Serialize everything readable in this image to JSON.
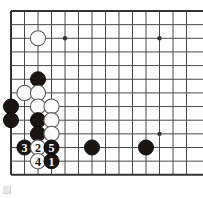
{
  "diagram": {
    "kind": "go-board-diagram",
    "board": {
      "columns": 14,
      "rows": 13,
      "origin_x": 11,
      "origin_y": 11,
      "step_x": 13.5,
      "step_y": 13.65,
      "line_color": "#4a4a4a",
      "edge_color": "#333333",
      "line_width": 1,
      "edge_width": 2,
      "background_color": "#ffffff",
      "left_edge_is_border": true,
      "top_edge_is_border": true,
      "bottom_edge_is_border": true,
      "right_edge_is_border": false
    },
    "star_points": [
      {
        "name": "star-point-upper-left",
        "col": 4,
        "row": 2
      },
      {
        "name": "star-point-upper-right",
        "col": 11,
        "row": 2
      },
      {
        "name": "star-point-lower-right",
        "col": 11,
        "row": 9
      }
    ],
    "star_point_radius": 2.2,
    "stone_radius": 7.6,
    "stones": [
      {
        "id": "w-top-left",
        "color": "white",
        "col": 2,
        "row": 2,
        "label": ""
      },
      {
        "id": "b-upper",
        "color": "black",
        "col": 2,
        "row": 5,
        "label": ""
      },
      {
        "id": "w-r6-c1",
        "color": "white",
        "col": 1,
        "row": 6,
        "label": ""
      },
      {
        "id": "w-r6-c2",
        "color": "white",
        "col": 2,
        "row": 6,
        "label": ""
      },
      {
        "id": "b-r7-c0",
        "color": "black",
        "col": 0,
        "row": 7,
        "label": ""
      },
      {
        "id": "w-r7-c2",
        "color": "white",
        "col": 2,
        "row": 7,
        "label": ""
      },
      {
        "id": "w-r7-c3",
        "color": "white",
        "col": 3,
        "row": 7,
        "label": ""
      },
      {
        "id": "b-r8-c0",
        "color": "black",
        "col": 0,
        "row": 8,
        "label": ""
      },
      {
        "id": "b-r8-c2",
        "color": "black",
        "col": 2,
        "row": 8,
        "label": ""
      },
      {
        "id": "w-r8-c3",
        "color": "white",
        "col": 3,
        "row": 8,
        "label": ""
      },
      {
        "id": "b-r9-c2",
        "color": "black",
        "col": 2,
        "row": 9,
        "label": ""
      },
      {
        "id": "w-r9-c3",
        "color": "white",
        "col": 3,
        "row": 9,
        "label": ""
      },
      {
        "id": "move-3",
        "color": "black",
        "col": 1,
        "row": 10,
        "label": "3"
      },
      {
        "id": "move-2",
        "color": "white",
        "col": 2,
        "row": 10,
        "label": "2"
      },
      {
        "id": "move-5",
        "color": "black",
        "col": 3,
        "row": 10,
        "label": "5"
      },
      {
        "id": "b-r10-c6",
        "color": "black",
        "col": 6,
        "row": 10,
        "label": ""
      },
      {
        "id": "b-r10-c10",
        "color": "black",
        "col": 10,
        "row": 10,
        "label": ""
      },
      {
        "id": "move-4",
        "color": "white",
        "col": 2,
        "row": 11,
        "label": "4"
      },
      {
        "id": "move-1",
        "color": "black",
        "col": 3,
        "row": 11,
        "label": "1"
      }
    ],
    "move_sequence": [
      {
        "number": "1",
        "color": "black"
      },
      {
        "number": "2",
        "color": "white"
      },
      {
        "number": "3",
        "color": "black"
      },
      {
        "number": "4",
        "color": "white"
      },
      {
        "number": "5",
        "color": "black"
      }
    ],
    "colors": {
      "black_stone_fill": "#1a1512",
      "black_stone_stroke": "#000000",
      "white_stone_fill": "#fdfdfd",
      "white_stone_stroke": "#5a5a5a",
      "black_label_text": "#ffffff",
      "white_label_text": "#1a1512"
    }
  }
}
